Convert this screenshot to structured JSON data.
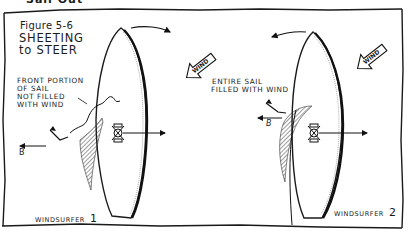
{
  "figure": {
    "cut_text_top": "Sail Out",
    "number_label": "Figure 5-6",
    "title_line1": "SHEETING",
    "title_line2": "to STEER"
  },
  "left_panel": {
    "annotation": [
      "FRONT PORTION",
      "OF SAIL",
      "NOT FILLED",
      "WITH WIND"
    ],
    "wind_label": "WIND",
    "force_label": "B",
    "caption": "WINDSURFER",
    "caption_number": "1"
  },
  "right_panel": {
    "annotation": [
      "ENTIRE SAIL",
      "FILLED WITH WIND"
    ],
    "wind_label": "WIND",
    "force_label": "B",
    "caption": "WINDSURFER",
    "caption_number": "2"
  },
  "colors": {
    "ink": "#1a1a1a",
    "paper": "#ffffff"
  }
}
